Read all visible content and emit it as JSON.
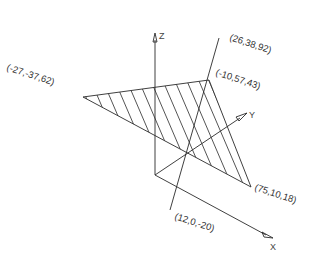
{
  "diagram": {
    "type": "3d-line-plane-intersection",
    "axes": {
      "x_label": "X",
      "y_label": "Y",
      "z_label": "Z"
    },
    "plane": {
      "vertices": [
        {
          "label": "(-27,-37,62)",
          "coords": [
            -27,
            -37,
            62
          ]
        },
        {
          "label": "(-10,57,43)",
          "coords": [
            -10,
            57,
            43
          ]
        },
        {
          "label": "(75,10,18)",
          "coords": [
            75,
            10,
            18
          ]
        }
      ],
      "fill": "hatched"
    },
    "line": {
      "endpoints": [
        {
          "label": "(26,38,92)",
          "coords": [
            26,
            38,
            92
          ]
        },
        {
          "label": "(12,0,-20)",
          "coords": [
            12,
            0,
            -20
          ]
        }
      ]
    },
    "colors": {
      "stroke": "#2a2a2a",
      "background": "#ffffff"
    }
  }
}
